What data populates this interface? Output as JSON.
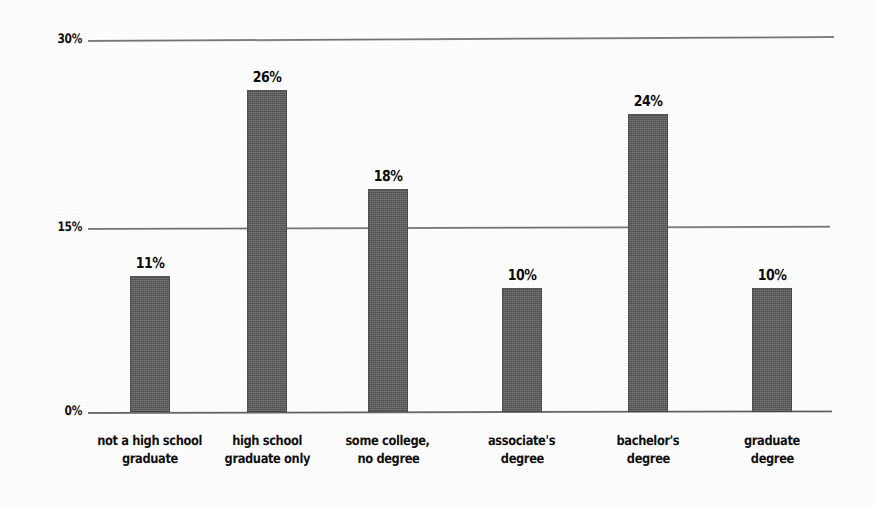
{
  "chart_data": {
    "type": "bar",
    "title": "",
    "subtitle": "",
    "xlabel": "",
    "ylabel": "",
    "ylim": [
      0,
      30
    ],
    "yunit": "%",
    "grid": true,
    "legend": "none",
    "gridline_values": [
      30,
      15,
      0
    ],
    "ytick_labels": [
      "30%",
      "15%",
      "0%"
    ],
    "categories": [
      "not a high school graduate",
      "high school graduate only",
      "some college, no degree",
      "associate's degree",
      "bachelor's degree",
      "graduate degree"
    ],
    "category_label_lines": [
      [
        "not a high school",
        "graduate"
      ],
      [
        "high school",
        "graduate only"
      ],
      [
        "some college,",
        "no degree"
      ],
      [
        "associate's",
        "degree"
      ],
      [
        "bachelor's",
        "degree"
      ],
      [
        "graduate",
        "degree"
      ]
    ],
    "values": [
      11,
      26,
      18,
      10,
      24,
      10
    ],
    "value_labels": [
      "11%",
      "26%",
      "18%",
      "10%",
      "24%",
      "10%"
    ],
    "bar_color": "#5c5c5c",
    "gridline_color": "#6f6f6f",
    "text_color": "#111111",
    "background_color": "#fdfdfd"
  },
  "layout": {
    "bar_slot_left_px": [
      42,
      159,
      280,
      414,
      540,
      664
    ],
    "bar_width_px": 40
  }
}
